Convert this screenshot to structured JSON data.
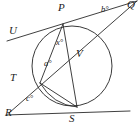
{
  "figure": {
    "type": "geometry-diagram",
    "stroke_color": "#2a2a2a",
    "circle_color": "#3a3a3a",
    "background_color": "#ffffff",
    "canvas": {
      "width": 138,
      "height": 129
    }
  },
  "circle": {
    "center_x": 72,
    "center_y": 66,
    "radius": 40
  },
  "points": [
    {
      "id": "P",
      "label": "P",
      "x": 63,
      "y": 24,
      "label_x": 58,
      "label_y": 4
    },
    {
      "id": "Q",
      "label": "Q",
      "x": 137,
      "y": 1,
      "label_x": 127,
      "label_y": 1
    },
    {
      "id": "U",
      "label": "U",
      "x": 17,
      "y": 36,
      "label_x": 9,
      "label_y": 26
    },
    {
      "id": "V",
      "label": "V",
      "x": 90,
      "y": 57,
      "label_x": 76,
      "label_y": 48
    },
    {
      "id": "T",
      "label": "T",
      "x": 40,
      "y": 83,
      "label_x": 10,
      "label_y": 72
    },
    {
      "id": "S",
      "label": "S",
      "x": 77,
      "y": 107,
      "label_x": 69,
      "label_y": 113
    },
    {
      "id": "R",
      "label": "R",
      "x": 9,
      "y": 113,
      "label_x": 6,
      "label_y": 107
    }
  ],
  "angles": [
    {
      "id": "x",
      "label": "x°",
      "label_x": 56,
      "label_y": 38
    },
    {
      "id": "a",
      "label": "a°",
      "label_x": 44,
      "label_y": 59
    },
    {
      "id": "b",
      "label": "b°",
      "label_x": 101,
      "label_y": 5
    },
    {
      "id": "c",
      "label": "c°",
      "label_x": 26,
      "label_y": 94
    }
  ],
  "segments": [
    {
      "id": "UQ",
      "name": "tangent-line-u-q",
      "x1": 7,
      "y1": 41,
      "x2": 137,
      "y2": 1
    },
    {
      "id": "RS",
      "name": "tangent-line-r-s",
      "x1": 6,
      "y1": 115,
      "x2": 130,
      "y2": 111
    },
    {
      "id": "RQ",
      "name": "secant-line-r-q",
      "x1": 9,
      "y1": 113,
      "x2": 137,
      "y2": 1
    },
    {
      "id": "PS",
      "name": "chord-p-s",
      "x1": 63,
      "y1": 24,
      "x2": 77,
      "y2": 107
    },
    {
      "id": "PT",
      "name": "chord-p-t",
      "x1": 63,
      "y1": 24,
      "x2": 40,
      "y2": 83
    },
    {
      "id": "TS",
      "name": "chord-t-s",
      "x1": 40,
      "y1": 83,
      "x2": 77,
      "y2": 107
    }
  ],
  "arcs": [
    {
      "id": "TS-arc",
      "name": "arc-t-s",
      "d": "M 40 83 Q 52 104 77 107"
    }
  ]
}
